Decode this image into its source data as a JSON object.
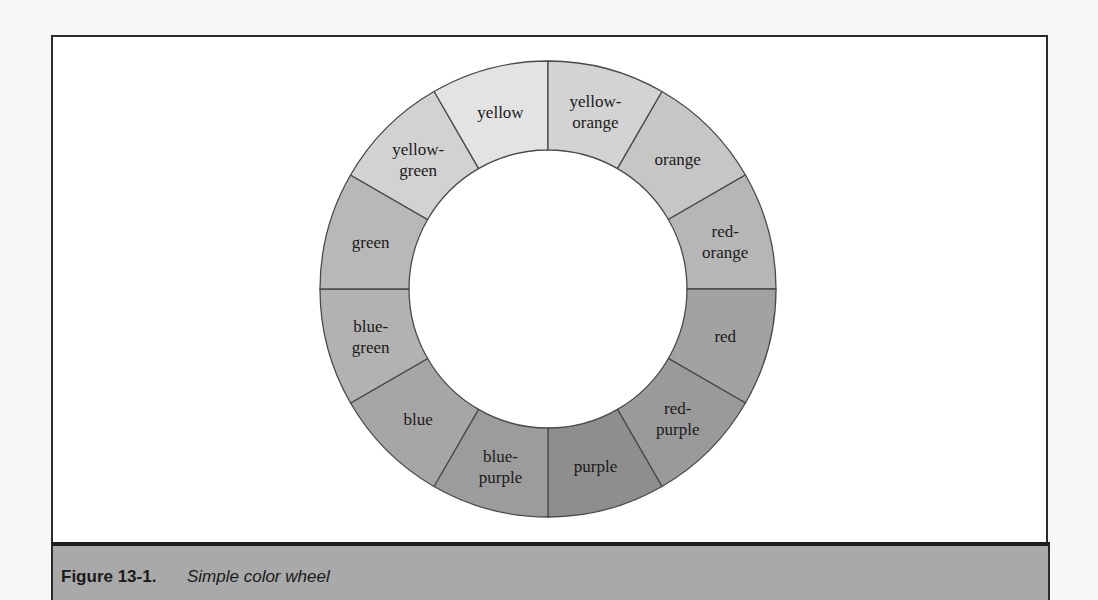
{
  "figure": {
    "number": "Figure 13-1.",
    "title": "Simple color wheel"
  },
  "wheel": {
    "center": [
      548,
      289
    ],
    "outer_radius": 228,
    "inner_radius": 139,
    "stroke": "#4a4a4a",
    "segments": [
      {
        "label": "yellow",
        "lines": [
          "yellow"
        ],
        "fill": "#e3e3e3"
      },
      {
        "label": "yellow-orange",
        "lines": [
          "yellow-",
          "orange"
        ],
        "fill": "#d3d3d3"
      },
      {
        "label": "orange",
        "lines": [
          "orange"
        ],
        "fill": "#c6c6c6"
      },
      {
        "label": "red-orange",
        "lines": [
          "red-",
          "orange"
        ],
        "fill": "#b6b6b6"
      },
      {
        "label": "red",
        "lines": [
          "red"
        ],
        "fill": "#a2a2a2"
      },
      {
        "label": "red-purple",
        "lines": [
          "red-",
          "purple"
        ],
        "fill": "#9a9a9a"
      },
      {
        "label": "purple",
        "lines": [
          "purple"
        ],
        "fill": "#8e8e8e"
      },
      {
        "label": "blue-purple",
        "lines": [
          "blue-",
          "purple"
        ],
        "fill": "#9c9c9c"
      },
      {
        "label": "blue",
        "lines": [
          "blue"
        ],
        "fill": "#a6a6a6"
      },
      {
        "label": "blue-green",
        "lines": [
          "blue-",
          "green"
        ],
        "fill": "#b2b2b2"
      },
      {
        "label": "green",
        "lines": [
          "green"
        ],
        "fill": "#b8b8b8"
      },
      {
        "label": "yellow-green",
        "lines": [
          "yellow-",
          "green"
        ],
        "fill": "#d2d2d2"
      }
    ]
  }
}
